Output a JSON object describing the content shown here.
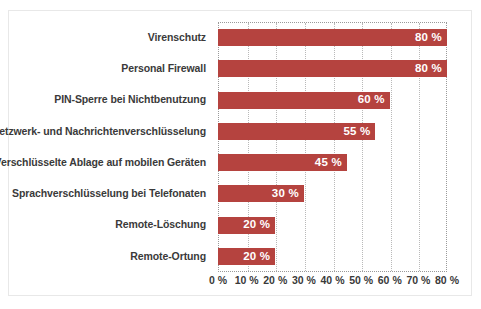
{
  "chart_data": {
    "type": "bar",
    "orientation": "horizontal",
    "title": "",
    "subtitle": "",
    "xlabel": "",
    "ylabel": "",
    "grid": true,
    "legend": null,
    "xlim": [
      0,
      80
    ],
    "categories": [
      "Virenschutz",
      "Personal Firewall",
      "PIN-Sperre bei Nichtbenutzung",
      "Netzwerk- und Nachrichtenverschlüsselung",
      "Verschlüsselte Ablage auf mobilen Geräten",
      "Sprachverschlüsselung bei Telefonaten",
      "Remote-Löschung",
      "Remote-Ortung"
    ],
    "values": [
      80,
      80,
      60,
      55,
      45,
      30,
      20,
      20
    ],
    "value_labels": [
      "80 %",
      "80 %",
      "60 %",
      "55 %",
      "45 %",
      "30 %",
      "20 %",
      "20 %"
    ],
    "xticks": [
      0,
      10,
      20,
      30,
      40,
      50,
      60,
      70,
      80
    ],
    "xtick_labels": [
      "0 %",
      "10 %",
      "20 %",
      "30 %",
      "40 %",
      "50 %",
      "60 %",
      "70 %",
      "80 %"
    ],
    "colors": {
      "bar": "#b5433f",
      "bar_value_text": "#ffffff",
      "category_text": "#3a3a3a",
      "tick_text": "#3a3a3a",
      "gridline": "#b9b9b9",
      "plot_border": "#9a9a9a",
      "figure_border": "#e8e8e8",
      "background": "#ffffff"
    }
  },
  "caption": ""
}
